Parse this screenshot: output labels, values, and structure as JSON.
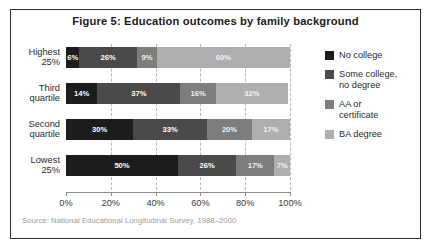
{
  "figure": {
    "title": "Figure 5: Education outcomes by family background",
    "source": "Source: National Educational Longitudinal Survey, 1988–2000"
  },
  "colors": {
    "no_college": "#1c1c1c",
    "some_college": "#4a4a4a",
    "aa_certificate": "#7d7d7d",
    "ba_degree": "#aeaeae",
    "frame": "#2b2b2b",
    "gridline": "#b9b9b9",
    "axis": "#8a8a8a"
  },
  "legend": {
    "items": [
      {
        "label": "No college",
        "color": "#1c1c1c"
      },
      {
        "label": "Some college,\nno degree",
        "line1": "Some college,",
        "line2": "no degree",
        "color": "#4a4a4a"
      },
      {
        "label": "AA or\ncertificate",
        "line1": "AA or",
        "line2": "certificate",
        "color": "#7d7d7d"
      },
      {
        "label": "BA degree",
        "line1": "BA degree",
        "line2": "",
        "color": "#aeaeae"
      }
    ]
  },
  "axis": {
    "ticks": [
      "0%",
      "20%",
      "40%",
      "60%",
      "80%",
      "100%"
    ],
    "tick_values": [
      0,
      20,
      40,
      60,
      80,
      100
    ]
  },
  "categories": [
    {
      "line1": "Highest",
      "line2": "25%"
    },
    {
      "line1": "Third",
      "line2": "quartile"
    },
    {
      "line1": "Second",
      "line2": "quartile"
    },
    {
      "line1": "Lowest",
      "line2": "25%"
    }
  ],
  "chart_data": {
    "type": "bar",
    "orientation": "horizontal",
    "stacked": true,
    "normalized": true,
    "title": "Figure 5: Education outcomes by family background",
    "xlabel": "",
    "ylabel": "",
    "xlim": [
      0,
      100
    ],
    "xticks": [
      0,
      20,
      40,
      60,
      80,
      100
    ],
    "xticklabels": [
      "0%",
      "20%",
      "40%",
      "60%",
      "80%",
      "100%"
    ],
    "grid": "vertical-dashed",
    "legend_position": "right",
    "categories": [
      "Highest 25%",
      "Third quartile",
      "Second quartile",
      "Lowest 25%"
    ],
    "series": [
      {
        "name": "No college",
        "color": "#1c1c1c",
        "values": [
          6,
          14,
          30,
          50
        ]
      },
      {
        "name": "Some college, no degree",
        "color": "#4a4a4a",
        "values": [
          26,
          37,
          33,
          26
        ]
      },
      {
        "name": "AA or certificate",
        "color": "#7d7d7d",
        "values": [
          9,
          16,
          20,
          17
        ]
      },
      {
        "name": "BA degree",
        "color": "#aeaeae",
        "values": [
          60,
          32,
          17,
          7
        ]
      }
    ],
    "data_labels": [
      [
        "6%",
        "26%",
        "9%",
        "60%"
      ],
      [
        "14%",
        "37%",
        "16%",
        "32%"
      ],
      [
        "30%",
        "33%",
        "20%",
        "17%"
      ],
      [
        "50%",
        "26%",
        "17%",
        "7%"
      ]
    ],
    "source": "Source: National Educational Longitudinal Survey, 1988–2000"
  }
}
